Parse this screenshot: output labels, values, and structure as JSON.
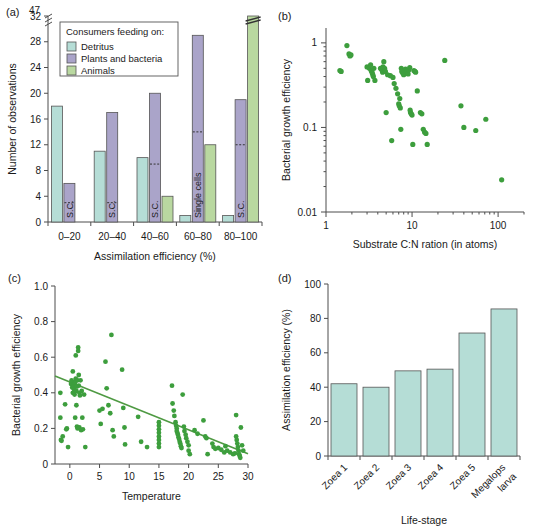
{
  "figure": {
    "panels": [
      "(a)",
      "(b)",
      "(c)",
      "(d)"
    ]
  },
  "colors": {
    "detritus": "#b5ddd6",
    "plants_bacteria": "#aaa4c9",
    "animals": "#b9d8a0",
    "scatter_green": "#3d9e3d",
    "line_green": "#4f9a43",
    "axis": "#4d4d4d"
  },
  "chart_data": [
    {
      "panel": "(a)",
      "type": "bar",
      "title": "",
      "xlabel": "Assimilation efficiency (%)",
      "ylabel": "Number of observations",
      "categories": [
        "0–20",
        "20–40",
        "40–60",
        "60–80",
        "80–100"
      ],
      "ytick_labels": [
        "0",
        "4",
        "8",
        "12",
        "16",
        "20",
        "24",
        "28",
        "32",
        "47"
      ],
      "ylim": [
        0,
        32
      ],
      "axis_break": {
        "below": 32,
        "above": 47,
        "note": "broken y-axis between 32 and 47"
      },
      "legend": {
        "title": "Consumers feeding on:",
        "entries": [
          "Detritus",
          "Plants and bacteria",
          "Animals"
        ],
        "position": "upper-left-inside"
      },
      "series": [
        {
          "name": "Detritus",
          "values": [
            18,
            11,
            10,
            1,
            1
          ]
        },
        {
          "name": "Plants and bacteria",
          "values": [
            6,
            17,
            20,
            29,
            19
          ]
        },
        {
          "name": "Animals",
          "values": [
            0,
            0,
            4,
            12,
            47
          ]
        }
      ],
      "single_cell_markers": [
        {
          "category": "0–20",
          "series": "Plants and bacteria",
          "label": "S.C.",
          "dashed_level": 3
        },
        {
          "category": "20–40",
          "series": "Plants and bacteria",
          "label": "S.C.",
          "dashed_level": 3
        },
        {
          "category": "40–60",
          "series": "Plants and bacteria",
          "label": "S.C.",
          "dashed_level": 9
        },
        {
          "category": "60–80",
          "series": "Plants and bacteria",
          "label": "Single cells",
          "dashed_level": 14
        },
        {
          "category": "80–100",
          "series": "Plants and bacteria",
          "label": "S.C.",
          "dashed_level": 12
        }
      ]
    },
    {
      "panel": "(b)",
      "type": "scatter",
      "title": "",
      "xlabel": "Substrate C:N ration (in atoms)",
      "ylabel": "Bacterial growth efficiency",
      "xscale": "log",
      "yscale": "log",
      "xlim": [
        1,
        200
      ],
      "ylim": [
        0.01,
        1.5
      ],
      "xtick_labels": [
        "1",
        "10",
        "100"
      ],
      "ytick_labels": [
        "0.01",
        "0.1",
        "1"
      ],
      "grid": false,
      "points": [
        [
          1.45,
          0.47
        ],
        [
          1.5,
          0.46
        ],
        [
          1.75,
          0.93
        ],
        [
          1.85,
          0.74
        ],
        [
          1.9,
          0.7
        ],
        [
          1.95,
          0.72
        ],
        [
          3.0,
          0.52
        ],
        [
          3.05,
          0.36
        ],
        [
          3.2,
          0.5
        ],
        [
          3.3,
          0.55
        ],
        [
          3.35,
          0.47
        ],
        [
          3.4,
          0.46
        ],
        [
          3.45,
          0.44
        ],
        [
          3.5,
          0.42
        ],
        [
          3.55,
          0.4
        ],
        [
          3.6,
          0.5
        ],
        [
          3.7,
          0.36
        ],
        [
          4.3,
          0.5
        ],
        [
          4.4,
          0.49
        ],
        [
          4.5,
          0.47
        ],
        [
          4.55,
          0.45
        ],
        [
          4.6,
          0.52
        ],
        [
          4.7,
          0.6
        ],
        [
          4.8,
          0.5
        ],
        [
          4.9,
          0.46
        ],
        [
          5.0,
          0.15
        ],
        [
          5.2,
          0.42
        ],
        [
          5.6,
          0.41
        ],
        [
          5.8,
          0.07
        ],
        [
          6.0,
          0.39
        ],
        [
          6.2,
          0.33
        ],
        [
          6.5,
          0.29
        ],
        [
          6.8,
          0.25
        ],
        [
          7.0,
          0.19
        ],
        [
          7.1,
          0.18
        ],
        [
          7.2,
          0.22
        ],
        [
          7.3,
          0.17
        ],
        [
          7.4,
          0.095
        ],
        [
          7.5,
          0.5
        ],
        [
          7.6,
          0.46
        ],
        [
          7.8,
          0.44
        ],
        [
          8.0,
          0.42
        ],
        [
          8.2,
          0.47
        ],
        [
          8.4,
          0.49
        ],
        [
          8.6,
          0.46
        ],
        [
          8.8,
          0.44
        ],
        [
          9.0,
          0.43
        ],
        [
          9.2,
          0.48
        ],
        [
          9.4,
          0.51
        ],
        [
          9.5,
          0.16
        ],
        [
          9.6,
          0.15
        ],
        [
          9.8,
          0.145
        ],
        [
          10.0,
          0.14
        ],
        [
          10.2,
          0.063
        ],
        [
          10.5,
          0.47
        ],
        [
          10.8,
          0.46
        ],
        [
          11.0,
          0.45
        ],
        [
          11.5,
          0.27
        ],
        [
          12.5,
          0.15
        ],
        [
          13.0,
          0.145
        ],
        [
          13.5,
          0.095
        ],
        [
          14.0,
          0.088
        ],
        [
          14.5,
          0.085
        ],
        [
          15.0,
          0.063
        ],
        [
          24.0,
          0.62
        ],
        [
          37.0,
          0.18
        ],
        [
          40.0,
          0.1
        ],
        [
          55.0,
          0.092
        ],
        [
          72.0,
          0.125
        ],
        [
          110.0,
          0.024
        ]
      ]
    },
    {
      "panel": "(c)",
      "type": "scatter",
      "title": "",
      "xlabel": "Temperature",
      "ylabel": "Bacterial growth efficiency",
      "xlim": [
        -2.5,
        30
      ],
      "ylim": [
        0,
        1.0
      ],
      "xtick_labels": [
        "0",
        "5",
        "10",
        "15",
        "20",
        "25",
        "30"
      ],
      "ytick_labels": [
        "0",
        "0.2",
        "0.4",
        "0.6",
        "0.8",
        "1.0"
      ],
      "grid": false,
      "regression_line": {
        "x1": -2.5,
        "y1": 0.495,
        "x2": 30,
        "y2": 0.057
      },
      "points": [
        [
          -1.6,
          0.4
        ],
        [
          -1.6,
          0.26
        ],
        [
          -1.5,
          0.135
        ],
        [
          -1.4,
          0.13
        ],
        [
          -1.2,
          0.155
        ],
        [
          -0.8,
          0.335
        ],
        [
          -0.6,
          0.195
        ],
        [
          -0.5,
          0.2
        ],
        [
          -0.3,
          0.095
        ],
        [
          0.2,
          0.45
        ],
        [
          0.3,
          0.47
        ],
        [
          0.4,
          0.43
        ],
        [
          0.5,
          0.4
        ],
        [
          0.5,
          0.52
        ],
        [
          0.6,
          0.44
        ],
        [
          0.7,
          0.42
        ],
        [
          0.8,
          0.455
        ],
        [
          0.8,
          0.39
        ],
        [
          0.9,
          0.46
        ],
        [
          0.9,
          0.26
        ],
        [
          1.0,
          0.48
        ],
        [
          1.0,
          0.61
        ],
        [
          1.1,
          0.41
        ],
        [
          1.1,
          0.33
        ],
        [
          1.2,
          0.435
        ],
        [
          1.2,
          0.21
        ],
        [
          1.3,
          0.47
        ],
        [
          1.3,
          0.2
        ],
        [
          1.4,
          0.655
        ],
        [
          1.4,
          0.635
        ],
        [
          1.5,
          0.5
        ],
        [
          1.5,
          0.44
        ],
        [
          1.6,
          0.4
        ],
        [
          1.6,
          0.205
        ],
        [
          1.7,
          0.385
        ],
        [
          1.8,
          0.47
        ],
        [
          1.9,
          0.19
        ],
        [
          2.0,
          0.41
        ],
        [
          2.1,
          0.26
        ],
        [
          2.2,
          0.195
        ],
        [
          2.4,
          0.39
        ],
        [
          2.6,
          0.095
        ],
        [
          5.0,
          0.3
        ],
        [
          5.2,
          0.225
        ],
        [
          5.5,
          0.31
        ],
        [
          6.0,
          0.575
        ],
        [
          6.2,
          0.425
        ],
        [
          6.5,
          0.33
        ],
        [
          6.8,
          0.285
        ],
        [
          7.0,
          0.725
        ],
        [
          7.2,
          0.19
        ],
        [
          7.4,
          0.155
        ],
        [
          8.8,
          0.53
        ],
        [
          9.0,
          0.315
        ],
        [
          9.2,
          0.205
        ],
        [
          9.3,
          0.11
        ],
        [
          11.5,
          0.265
        ],
        [
          12.0,
          0.125
        ],
        [
          13.0,
          0.095
        ],
        [
          15.0,
          0.235
        ],
        [
          15.0,
          0.215
        ],
        [
          15.0,
          0.195
        ],
        [
          15.0,
          0.175
        ],
        [
          15.0,
          0.155
        ],
        [
          15.0,
          0.135
        ],
        [
          15.0,
          0.115
        ],
        [
          15.0,
          0.095
        ],
        [
          17.2,
          0.44
        ],
        [
          17.3,
          0.34
        ],
        [
          17.5,
          0.3
        ],
        [
          17.6,
          0.27
        ],
        [
          17.8,
          0.235
        ],
        [
          17.9,
          0.215
        ],
        [
          18.0,
          0.2
        ],
        [
          18.0,
          0.185
        ],
        [
          18.1,
          0.175
        ],
        [
          18.2,
          0.165
        ],
        [
          18.3,
          0.15
        ],
        [
          18.4,
          0.14
        ],
        [
          18.5,
          0.125
        ],
        [
          18.6,
          0.115
        ],
        [
          18.7,
          0.1
        ],
        [
          18.8,
          0.09
        ],
        [
          19.0,
          0.39
        ],
        [
          19.2,
          0.21
        ],
        [
          19.3,
          0.185
        ],
        [
          19.5,
          0.165
        ],
        [
          19.6,
          0.145
        ],
        [
          19.8,
          0.125
        ],
        [
          20.0,
          0.105
        ],
        [
          20.0,
          0.075
        ],
        [
          20.2,
          0.055
        ],
        [
          21.0,
          0.19
        ],
        [
          21.5,
          0.17
        ],
        [
          22.5,
          0.245
        ],
        [
          22.8,
          0.155
        ],
        [
          23.0,
          0.145
        ],
        [
          23.2,
          0.055
        ],
        [
          24.0,
          0.115
        ],
        [
          24.2,
          0.095
        ],
        [
          24.5,
          0.085
        ],
        [
          25.0,
          0.09
        ],
        [
          25.5,
          0.08
        ],
        [
          26.0,
          0.065
        ],
        [
          26.2,
          0.1
        ],
        [
          26.5,
          0.075
        ],
        [
          27.0,
          0.065
        ],
        [
          27.5,
          0.055
        ],
        [
          27.8,
          0.06
        ],
        [
          28.0,
          0.275
        ],
        [
          28.0,
          0.155
        ],
        [
          28.1,
          0.135
        ],
        [
          28.2,
          0.115
        ],
        [
          28.3,
          0.095
        ],
        [
          28.4,
          0.075
        ],
        [
          28.5,
          0.055
        ],
        [
          28.6,
          0.045
        ],
        [
          28.7,
          0.035
        ],
        [
          28.8,
          0.205
        ],
        [
          29.0,
          0.105
        ],
        [
          29.2,
          0.075
        ]
      ]
    },
    {
      "panel": "(d)",
      "type": "bar",
      "title": "",
      "xlabel": "Life-stage",
      "ylabel": "Assimilation efficiency (%)",
      "categories": [
        "Zoea 1",
        "Zoea 2",
        "Zoea 3",
        "Zoea 4",
        "Zoea 5",
        "Megalops larva"
      ],
      "values": [
        42.0,
        40.0,
        49.5,
        50.5,
        71.5,
        85.5
      ],
      "ylim": [
        0,
        100
      ],
      "ytick_labels": [
        "0",
        "20",
        "40",
        "60",
        "80",
        "100"
      ],
      "grid": false
    }
  ]
}
